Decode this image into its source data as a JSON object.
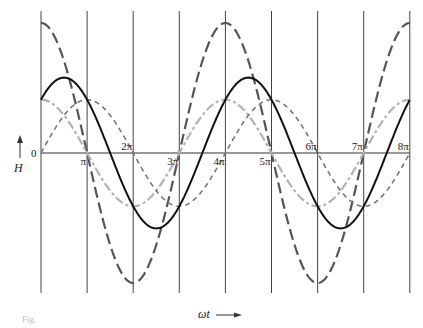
{
  "chart_data": {
    "type": "line",
    "title": "",
    "xlabel": "ωt",
    "ylabel": "H",
    "origin_label": "0",
    "x_unit": "π",
    "x_ticks": [
      {
        "value": 1,
        "label": "π",
        "pos": "below"
      },
      {
        "value": 2,
        "label": "2π",
        "pos": "above"
      },
      {
        "value": 3,
        "label": "3π",
        "pos": "below"
      },
      {
        "value": 4,
        "label": "4π",
        "pos": "below"
      },
      {
        "value": 5,
        "label": "5π",
        "pos": "below"
      },
      {
        "value": 6,
        "label": "6π",
        "pos": "above"
      },
      {
        "value": 7,
        "label": "7π",
        "pos": "above"
      },
      {
        "value": 8,
        "label": "8π",
        "pos": "above"
      }
    ],
    "xlim": [
      0,
      8
    ],
    "ylim": [
      -1.05,
      1.05
    ],
    "grid": {
      "vertical_lines_at_multiples_of_pi": true,
      "horizontal": false
    },
    "legend": "none",
    "series": [
      {
        "name": "large-dashed",
        "formula": "1.0*cos(ωt/2)",
        "amplitude": 1.0,
        "phase_pi": 0,
        "color": "#555555",
        "style": "long-dash",
        "width": 2.2,
        "key_points": [
          [
            0,
            1.0
          ],
          [
            2,
            -1.0
          ],
          [
            4,
            1.0
          ],
          [
            6,
            -1.0
          ],
          [
            8,
            1.0
          ]
        ]
      },
      {
        "name": "light-gray-solid",
        "formula": "0.41*cos(ωt/2)",
        "amplitude": 0.41,
        "phase_pi": 0,
        "color": "#b3b3b3",
        "style": "dash-dot",
        "width": 2.2,
        "key_points": [
          [
            0,
            0.41
          ],
          [
            1,
            0
          ],
          [
            2,
            -0.41
          ],
          [
            3,
            0
          ],
          [
            4,
            0.41
          ],
          [
            8,
            0.41
          ]
        ]
      },
      {
        "name": "small-dashed",
        "formula": "0.41*sin(ωt/2)",
        "amplitude": 0.41,
        "phase_pi": 0.5,
        "color": "#777777",
        "style": "short-dash",
        "width": 1.6,
        "key_points": [
          [
            0,
            0
          ],
          [
            1,
            0.41
          ],
          [
            2,
            0
          ],
          [
            3,
            -0.41
          ],
          [
            4,
            0
          ],
          [
            5,
            0.41
          ],
          [
            8,
            0
          ]
        ]
      },
      {
        "name": "black-solid-resultant",
        "formula": "0.58*cos(ωt/2 - π/4)",
        "amplitude": 0.58,
        "phase_pi": 0.25,
        "color": "#111111",
        "style": "solid",
        "width": 2.0,
        "key_points": [
          [
            0,
            0.41
          ],
          [
            0.5,
            0.58
          ],
          [
            1.5,
            0
          ],
          [
            2.5,
            -0.58
          ],
          [
            3.5,
            0
          ],
          [
            4.5,
            0.58
          ],
          [
            8,
            0.41
          ]
        ]
      }
    ]
  },
  "layout": {
    "x0_px": 41,
    "px_per_pi": 46.1,
    "axis_y_px": 153,
    "y_scale_px": 130,
    "grid_top_px": 11,
    "grid_bottom_px": 293
  },
  "caption": "Fig."
}
